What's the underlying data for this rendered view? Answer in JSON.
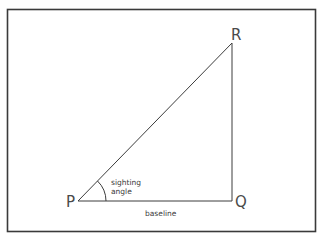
{
  "diagram": {
    "type": "right-triangle",
    "vertices": {
      "P": {
        "label": "P",
        "x": 78,
        "y": 201
      },
      "Q": {
        "label": "Q",
        "x": 232,
        "y": 201
      },
      "R": {
        "label": "R",
        "x": 232,
        "y": 43
      }
    },
    "edges": [
      {
        "from": "P",
        "to": "Q",
        "label": "baseline"
      },
      {
        "from": "Q",
        "to": "R",
        "label": ""
      },
      {
        "from": "P",
        "to": "R",
        "label": ""
      }
    ],
    "angle": {
      "at": "P",
      "label_line1": "sighting",
      "label_line2": "angle"
    },
    "labels": {
      "P": "P",
      "Q": "Q",
      "R": "R",
      "baseline": "baseline",
      "sighting": "sighting",
      "angle": "angle"
    },
    "colors": {
      "stroke": "#3c3c3c",
      "frame": "#3a3a3a",
      "text": "#4a4a4a",
      "background": "#ffffff"
    }
  }
}
